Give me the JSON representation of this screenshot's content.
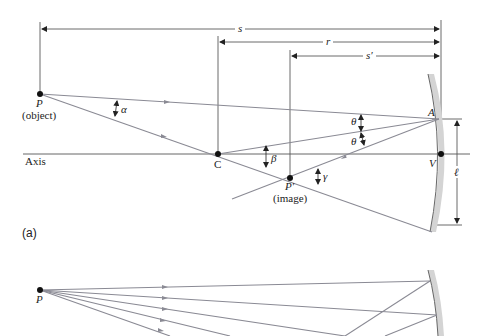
{
  "figure": {
    "panel_a": {
      "label": "(a)",
      "dimensions": {
        "s": "s",
        "r": "r",
        "s_prime": "s′",
        "ell": "ℓ"
      },
      "points": {
        "object": {
          "symbol": "P",
          "caption": "(object)"
        },
        "center": {
          "symbol": "C"
        },
        "image": {
          "symbol": "P′",
          "caption": "(image)"
        },
        "vertex": {
          "symbol": "V"
        },
        "mirror_point": {
          "symbol": "A"
        }
      },
      "angles": {
        "alpha": "α",
        "beta": "β",
        "gamma": "γ",
        "theta_1": "θ",
        "theta_2": "θ"
      },
      "axis_label": "Axis"
    },
    "panel_b": {
      "points": {
        "object": {
          "symbol": "P"
        }
      }
    },
    "colors": {
      "ray": "#8a8a94",
      "line": "#555555",
      "mirror_fill": "#d4d4d4",
      "mirror_edge": "#666666",
      "point": "#111111"
    }
  }
}
